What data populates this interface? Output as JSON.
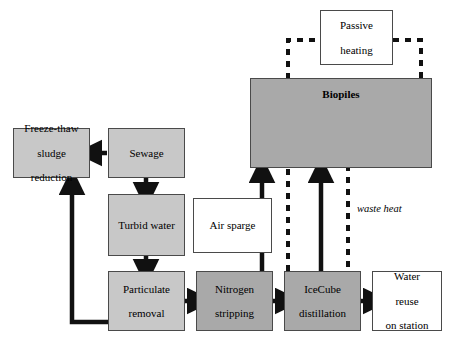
{
  "diagram": {
    "colors": {
      "fill_light_gray": "#c8c8c8",
      "fill_mid_gray": "#a9a9a9",
      "fill_white": "#ffffff",
      "stroke": "#4a4a4a",
      "arrow": "#111111",
      "dashed": "#111111"
    },
    "nodes": [
      {
        "id": "freeze_thaw",
        "label": "Freeze-thaw\nsludge\nreduction",
        "lines": [
          "Freeze-thaw",
          "sludge",
          "reduction"
        ],
        "fill": "light"
      },
      {
        "id": "sewage",
        "label": "Sewage",
        "lines": [
          "Sewage"
        ],
        "fill": "light"
      },
      {
        "id": "turbid_water",
        "label": "Turbid water",
        "lines": [
          "Turbid water"
        ],
        "fill": "light"
      },
      {
        "id": "particulate",
        "label": "Particulate\nremoval",
        "lines": [
          "Particulate",
          "removal"
        ],
        "fill": "light"
      },
      {
        "id": "nitrogen",
        "label": "Nitrogen\nstripping",
        "lines": [
          "Nitrogen",
          "stripping"
        ],
        "fill": "mid"
      },
      {
        "id": "icecube",
        "label": "IceCube\ndistillation",
        "lines": [
          "IceCube",
          "distillation"
        ],
        "fill": "mid"
      },
      {
        "id": "water_reuse",
        "label": "Water\nreuse\non station",
        "lines": [
          "Water",
          "reuse",
          "on station"
        ],
        "fill": "white"
      },
      {
        "id": "air_sparge",
        "label": "Air sparge",
        "lines": [
          "Air sparge"
        ],
        "fill": "white"
      },
      {
        "id": "biopiles",
        "label": "Biopiles",
        "lines": [
          "Biopiles"
        ],
        "fill": "mid"
      },
      {
        "id": "passive_heating",
        "label": "Passive\nheating",
        "lines": [
          "Passive",
          "heating"
        ],
        "fill": "white"
      }
    ],
    "labels": {
      "freeze_thaw_l1": "Freeze-thaw",
      "freeze_thaw_l2": "sludge",
      "freeze_thaw_l3": "reduction",
      "sewage": "Sewage",
      "turbid_water": "Turbid water",
      "particulate_l1": "Particulate",
      "particulate_l2": "removal",
      "nitrogen_l1": "Nitrogen",
      "nitrogen_l2": "stripping",
      "icecube_l1": "IceCube",
      "icecube_l2": "distillation",
      "water_reuse_l1": "Water",
      "water_reuse_l2": "reuse",
      "water_reuse_l3": "on station",
      "air_sparge": "Air sparge",
      "biopiles": "Biopiles",
      "passive_l1": "Passive",
      "passive_l2": "heating",
      "waste_heat": "waste heat"
    },
    "edges": [
      {
        "from": "sewage",
        "to": "freeze_thaw",
        "style": "solid",
        "label": ""
      },
      {
        "from": "sewage",
        "to": "turbid_water",
        "style": "solid",
        "label": ""
      },
      {
        "from": "turbid_water",
        "to": "particulate",
        "style": "solid",
        "label": ""
      },
      {
        "from": "particulate",
        "to": "freeze_thaw",
        "style": "solid",
        "label": ""
      },
      {
        "from": "particulate",
        "to": "nitrogen",
        "style": "solid",
        "label": ""
      },
      {
        "from": "nitrogen",
        "to": "icecube",
        "style": "solid",
        "label": ""
      },
      {
        "from": "icecube",
        "to": "water_reuse",
        "style": "solid",
        "label": ""
      },
      {
        "from": "nitrogen",
        "to": "biopiles",
        "style": "solid",
        "label": ""
      },
      {
        "from": "icecube",
        "to": "biopiles",
        "style": "solid",
        "label": ""
      },
      {
        "from": "biopiles",
        "to": "passive_heating",
        "style": "dashed",
        "label": ""
      },
      {
        "from": "passive_heating",
        "to": "biopiles",
        "style": "dashed",
        "label": ""
      },
      {
        "from": "icecube",
        "to": "biopiles",
        "style": "dashed",
        "label": "waste heat"
      }
    ]
  }
}
